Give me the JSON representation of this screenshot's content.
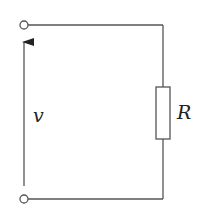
{
  "diagram": {
    "type": "circuit",
    "components": [
      {
        "kind": "resistor",
        "label": "R"
      },
      {
        "kind": "voltage-reference-arrow",
        "label": "v"
      },
      {
        "kind": "terminal",
        "position": "top"
      },
      {
        "kind": "terminal",
        "position": "bottom"
      }
    ],
    "labels": {
      "voltage": "v",
      "resistor": "R"
    },
    "colors": {
      "stroke": "#555555",
      "background": "#ffffff"
    }
  }
}
